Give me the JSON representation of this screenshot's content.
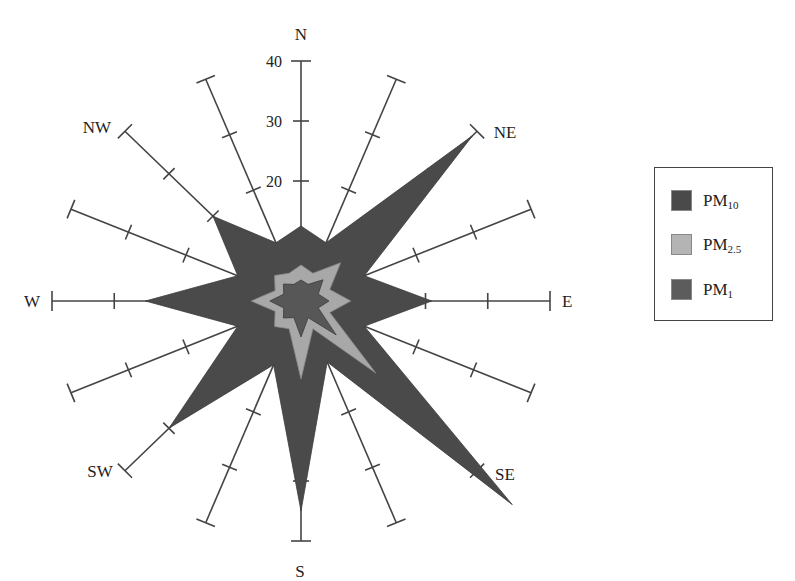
{
  "chart_data": {
    "type": "radar",
    "title": "",
    "directions": [
      "N",
      "NNE",
      "NE",
      "ENE",
      "E",
      "ESE",
      "SE",
      "SSE",
      "S",
      "SSW",
      "SW",
      "WSW",
      "W",
      "WNW",
      "NW",
      "NNW"
    ],
    "direction_labels_shown": {
      "N": "N",
      "NE": "NE",
      "E": "E",
      "SE": "SE",
      "S": "S",
      "SW": "SW",
      "W": "W",
      "NW": "NW"
    },
    "radial_ticks": [
      20,
      30,
      40
    ],
    "radial_tick_labels": [
      "20",
      "30",
      "40"
    ],
    "rlim": [
      0,
      40
    ],
    "tick_marks_at": [
      10,
      20,
      30,
      40
    ],
    "series": [
      {
        "name": "PM10",
        "label_main": "PM",
        "label_sub": "10",
        "color": "#4a4a4a",
        "values": [
          12.5,
          10.5,
          39,
          11,
          21,
          11,
          48,
          11,
          35,
          11.5,
          30,
          11,
          25,
          11,
          20,
          10.5
        ]
      },
      {
        "name": "PM2.5",
        "label_main": "PM",
        "label_sub": "2.5",
        "color": "#a8a8a8",
        "values": [
          6,
          5,
          9,
          5,
          8,
          5,
          17,
          5,
          13,
          5,
          6,
          4.5,
          8,
          4.5,
          6,
          5
        ]
      },
      {
        "name": "PM1",
        "label_main": "PM",
        "label_sub": "1",
        "color": "#555555",
        "values": [
          3.5,
          3,
          5,
          3,
          4.5,
          3,
          8,
          3,
          6,
          3,
          4,
          3,
          5,
          3,
          4,
          3
        ]
      }
    ],
    "legend_position": "right",
    "grid": false
  },
  "legend": {
    "items": [
      {
        "main": "PM",
        "sub": "10",
        "color": "#4a4a4a"
      },
      {
        "main": "PM",
        "sub": "2.5",
        "color": "#b4b4b4"
      },
      {
        "main": "PM",
        "sub": "1",
        "color": "#5c5c5c"
      }
    ]
  }
}
